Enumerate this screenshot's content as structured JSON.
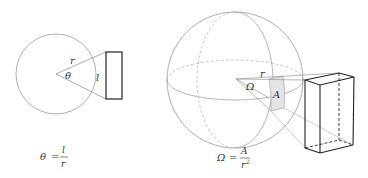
{
  "left_figure": {
    "title": "plane angle",
    "labels": {
      "radius": "r",
      "angle": "θ",
      "arc": "l"
    },
    "formula": {
      "lhs": "θ",
      "eq": "=",
      "numerator": "l",
      "denominator": "r"
    }
  },
  "right_figure": {
    "title": "solid angle",
    "labels": {
      "radius": "r",
      "solid_angle": "Ω",
      "area": "A"
    },
    "formula": {
      "lhs": "Ω",
      "eq": "=",
      "numerator": "A",
      "denominator": "r",
      "exponent": "2"
    }
  },
  "colors": {
    "circle_stroke": "#9a9a9a",
    "object_stroke": "#222222",
    "patch_fill": "#e4e4e4",
    "text": "#333333"
  }
}
